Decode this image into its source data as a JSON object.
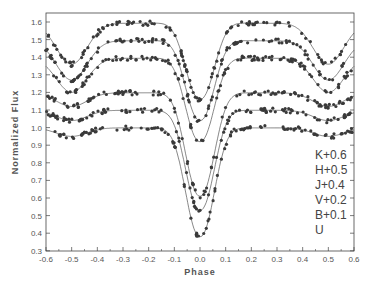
{
  "chart_data": {
    "type": "scatter",
    "title": "",
    "xlabel": "Phase",
    "ylabel": "Normalized Flux",
    "xlim": [
      -0.6,
      0.6
    ],
    "ylim": [
      0.3,
      1.65
    ],
    "xticks": [
      "-0.6",
      "-0.5",
      "-0.4",
      "-0.3",
      "-0.2",
      "-0.1",
      "0.0",
      "0.1",
      "0.2",
      "0.3",
      "0.4",
      "0.5",
      "0.6"
    ],
    "yticks": [
      "0.3",
      "0.4",
      "0.5",
      "0.6",
      "0.7",
      "0.8",
      "0.9",
      "1.0",
      "1.1",
      "1.2",
      "1.3",
      "1.4",
      "1.5",
      "1.6"
    ],
    "grid": false,
    "legend_position": "lower right (text labels)",
    "series": [
      {
        "name": "K+0.6",
        "offset": 0.6,
        "max": 1.6,
        "primary_min": 1.16,
        "secondary_min": 1.36
      },
      {
        "name": "H+0.5",
        "offset": 0.5,
        "max": 1.5,
        "primary_min": 1.04,
        "secondary_min": 1.27
      },
      {
        "name": "J+0.4",
        "offset": 0.4,
        "max": 1.4,
        "primary_min": 0.92,
        "secondary_min": 1.2
      },
      {
        "name": "V+0.2",
        "offset": 0.2,
        "max": 1.2,
        "primary_min": 0.61,
        "secondary_min": 1.12
      },
      {
        "name": "B+0.1",
        "offset": 0.1,
        "max": 1.1,
        "primary_min": 0.53,
        "secondary_min": 1.04
      },
      {
        "name": "U",
        "offset": 0.0,
        "max": 1.0,
        "primary_min": 0.38,
        "secondary_min": 0.95
      }
    ]
  },
  "legend": {
    "items": [
      "K+0.6",
      "H+0.5",
      "J+0.4",
      "V+0.2",
      "B+0.1",
      "U"
    ]
  },
  "axes": {
    "xlabel": "Phase",
    "ylabel": "Normalized Flux"
  }
}
